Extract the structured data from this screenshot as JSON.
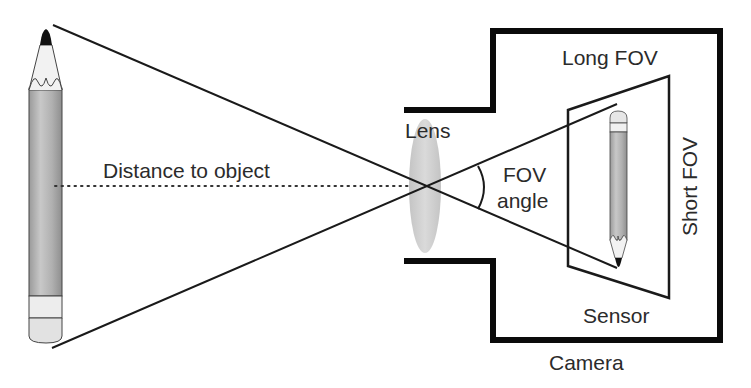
{
  "diagram": {
    "labels": {
      "distance": "Distance to object",
      "lens": "Lens",
      "fov_line1": "FOV",
      "fov_line2": "angle",
      "long_fov": "Long FOV",
      "short_fov": "Short FOV",
      "sensor": "Sensor",
      "camera": "Camera"
    },
    "colors": {
      "line": "#1a1a1a",
      "camera_body": "#0a0a0a",
      "lens_fill": "#cfcfcf",
      "pencil_body": "#b8b8b8",
      "pencil_eraser": "#e8e8e8",
      "pencil_tip": "#111111",
      "text": "#2b2b2b"
    },
    "elements": [
      {
        "id": "object-pencil",
        "kind": "pencil",
        "orientation": "tip-up"
      },
      {
        "id": "lens",
        "kind": "ellipse"
      },
      {
        "id": "camera-body",
        "kind": "outline"
      },
      {
        "id": "sensor",
        "kind": "trapezoid"
      },
      {
        "id": "image-pencil",
        "kind": "pencil",
        "orientation": "tip-down"
      },
      {
        "id": "rays",
        "kind": "crossing-lines"
      },
      {
        "id": "fov-arc",
        "kind": "arc"
      },
      {
        "id": "distance-line",
        "kind": "dotted-line"
      }
    ]
  }
}
